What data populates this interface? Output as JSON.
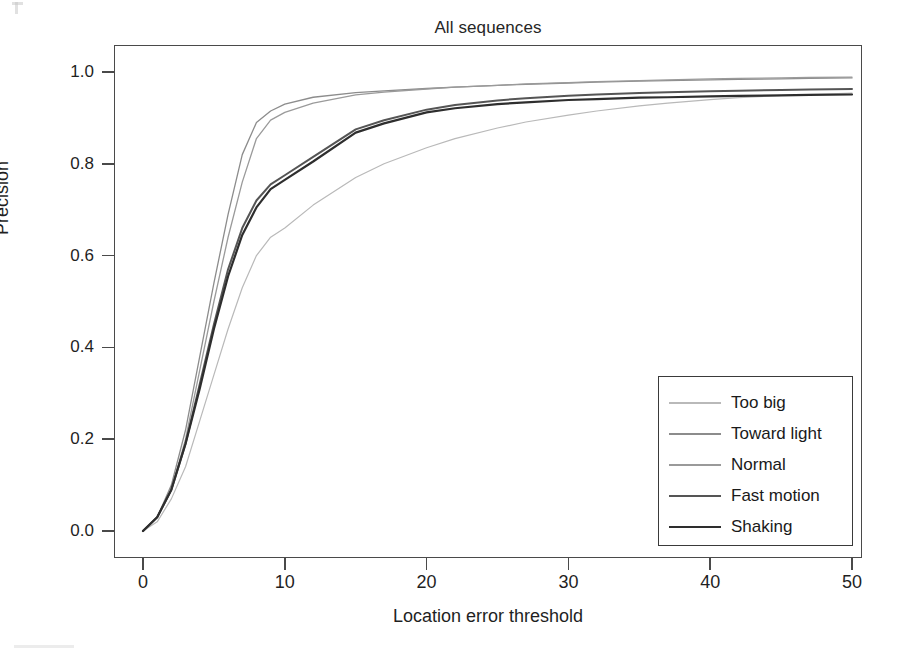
{
  "chart_data": {
    "type": "line",
    "title": "All sequences",
    "xlabel": "Location error threshold",
    "ylabel": "Precision",
    "xlim": [
      0,
      50
    ],
    "ylim": [
      0.0,
      1.0
    ],
    "xticks": [
      "0",
      "10",
      "20",
      "30",
      "40",
      "50"
    ],
    "xtick_values": [
      0,
      10,
      20,
      30,
      40,
      50
    ],
    "yticks": [
      "0.0",
      "0.2",
      "0.4",
      "0.6",
      "0.8",
      "1.0"
    ],
    "ytick_values": [
      0.0,
      0.2,
      0.4,
      0.6,
      0.8,
      1.0
    ],
    "grid": false,
    "legend_position": "lower right",
    "x": [
      0,
      1,
      2,
      3,
      4,
      5,
      6,
      7,
      8,
      9,
      10,
      12,
      15,
      17,
      20,
      22,
      25,
      27,
      30,
      32,
      35,
      37,
      40,
      42,
      45,
      47,
      50
    ],
    "series": [
      {
        "name": "Too big",
        "color": "#b9b9b9",
        "width": 1.2,
        "values": [
          0.0,
          0.02,
          0.07,
          0.14,
          0.24,
          0.34,
          0.44,
          0.53,
          0.6,
          0.64,
          0.66,
          0.71,
          0.77,
          0.8,
          0.835,
          0.855,
          0.878,
          0.891,
          0.906,
          0.915,
          0.926,
          0.932,
          0.94,
          0.944,
          0.949,
          0.951,
          0.954
        ]
      },
      {
        "name": "Toward light",
        "color": "#8c8c8c",
        "width": 1.3,
        "values": [
          0.0,
          0.03,
          0.1,
          0.22,
          0.38,
          0.54,
          0.69,
          0.82,
          0.89,
          0.915,
          0.93,
          0.945,
          0.955,
          0.959,
          0.964,
          0.967,
          0.971,
          0.973,
          0.976,
          0.978,
          0.98,
          0.981,
          0.983,
          0.984,
          0.985,
          0.986,
          0.987
        ]
      },
      {
        "name": "Normal",
        "color": "#9a9a9a",
        "width": 1.3,
        "values": [
          0.0,
          0.03,
          0.09,
          0.2,
          0.35,
          0.5,
          0.64,
          0.76,
          0.855,
          0.895,
          0.912,
          0.932,
          0.95,
          0.956,
          0.963,
          0.967,
          0.971,
          0.974,
          0.977,
          0.979,
          0.981,
          0.983,
          0.985,
          0.986,
          0.987,
          0.988,
          0.989
        ]
      },
      {
        "name": "Fast motion",
        "color": "#555555",
        "width": 2.0,
        "values": [
          0.0,
          0.03,
          0.09,
          0.19,
          0.32,
          0.45,
          0.57,
          0.66,
          0.72,
          0.755,
          0.775,
          0.815,
          0.875,
          0.895,
          0.918,
          0.928,
          0.938,
          0.943,
          0.948,
          0.951,
          0.954,
          0.956,
          0.958,
          0.959,
          0.961,
          0.962,
          0.963
        ]
      },
      {
        "name": "Shaking",
        "color": "#2e2e2e",
        "width": 2.2,
        "values": [
          0.0,
          0.03,
          0.09,
          0.19,
          0.31,
          0.44,
          0.555,
          0.645,
          0.705,
          0.745,
          0.765,
          0.805,
          0.868,
          0.888,
          0.912,
          0.921,
          0.93,
          0.934,
          0.939,
          0.941,
          0.944,
          0.945,
          0.947,
          0.948,
          0.949,
          0.95,
          0.951
        ]
      }
    ]
  },
  "legend": {
    "entries": [
      {
        "label": "Too big"
      },
      {
        "label": "Toward light"
      },
      {
        "label": "Normal"
      },
      {
        "label": "Fast motion"
      },
      {
        "label": "Shaking"
      }
    ]
  },
  "colors": {
    "frame": "#4a4a4a",
    "background": "#ffffff",
    "text": "#1a1a1a"
  }
}
